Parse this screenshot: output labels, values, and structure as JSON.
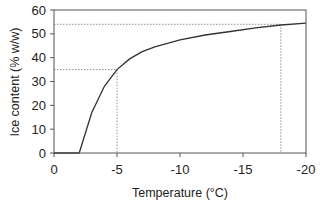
{
  "chart_data": {
    "type": "line",
    "title": "",
    "xlabel": "Temperature (°C)",
    "ylabel": "Ice content (% w/w)",
    "xlim": [
      0,
      -20
    ],
    "ylim": [
      0,
      60
    ],
    "x_ticks": [
      "0",
      "-5",
      "-10",
      "-15",
      "-20"
    ],
    "y_ticks": [
      "0",
      "10",
      "20",
      "30",
      "40",
      "50",
      "60"
    ],
    "grid": false,
    "legend": null,
    "series": [
      {
        "name": "Ice content",
        "x": [
          -2,
          -3,
          -4,
          -5,
          -6,
          -7,
          -8,
          -10,
          -12,
          -14,
          -16,
          -18,
          -20
        ],
        "y": [
          0,
          17,
          28,
          35,
          39.5,
          42.5,
          44.5,
          47.5,
          49.5,
          51,
          52.5,
          53.7,
          54.5
        ]
      }
    ],
    "annotations": [
      {
        "type": "dotted-reference",
        "x": -5,
        "y": 35
      },
      {
        "type": "dotted-reference",
        "x": -18,
        "y": 54
      }
    ]
  }
}
